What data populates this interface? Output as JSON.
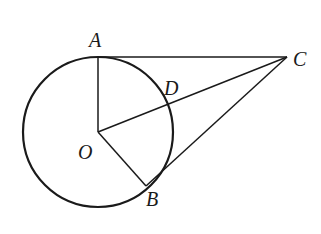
{
  "diagram": {
    "type": "geometry",
    "stroke_color": "#1a1a1a",
    "points": {
      "O": {
        "label": "O",
        "x": 98,
        "y": 132
      },
      "A": {
        "label": "A",
        "x": 98,
        "y": 57
      },
      "B": {
        "label": "B",
        "x": 146,
        "y": 186
      },
      "C": {
        "label": "C",
        "x": 287,
        "y": 57
      },
      "D": {
        "label": "D",
        "x": 171,
        "y": 103
      }
    },
    "circle": {
      "center": "O",
      "radius": 75
    },
    "segments": [
      [
        "O",
        "A"
      ],
      [
        "O",
        "B"
      ],
      [
        "O",
        "C"
      ],
      [
        "A",
        "C"
      ],
      [
        "B",
        "C"
      ]
    ]
  }
}
